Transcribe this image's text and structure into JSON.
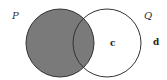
{
  "diagram": {
    "type": "venn",
    "sets": [
      {
        "name": "P",
        "label": "P",
        "shaded": true
      },
      {
        "name": "Q",
        "label": "Q",
        "shaded": false
      }
    ],
    "elements": [
      {
        "label": "c",
        "region": "Q only"
      },
      {
        "label": "d",
        "region": "outside both"
      }
    ],
    "shaded_region": "P",
    "colors": {
      "shade": "#7a7a7a",
      "outline": "#333333",
      "background": "#ffffff"
    }
  }
}
